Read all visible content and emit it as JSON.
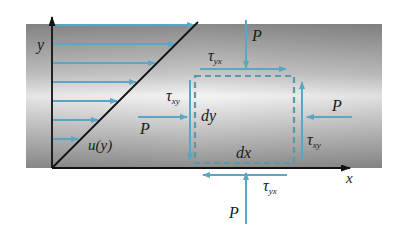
{
  "diagram": {
    "colors": {
      "band_dark": "#8e8e8e",
      "band_light": "#f2f2f2",
      "arrow": "#5aa6c4",
      "axis": "#111111"
    },
    "axes": {
      "x_label": "x",
      "y_label": "y"
    },
    "velocity_profile": {
      "label": "u(y)",
      "arrow_count": 7
    },
    "element": {
      "dx_label": "dx",
      "dy_label": "dy"
    },
    "forces": {
      "p_top": "P",
      "p_bottom": "P",
      "p_left": "P",
      "p_right": "P",
      "tau_top": {
        "main": "τ",
        "sub": "yx"
      },
      "tau_bottom": {
        "main": "τ",
        "sub": "yx"
      },
      "tau_left": {
        "main": "τ",
        "sub": "xy"
      },
      "tau_right": {
        "main": "τ",
        "sub": "xy"
      }
    }
  }
}
